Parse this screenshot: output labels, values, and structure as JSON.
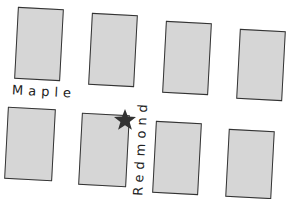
{
  "map": {
    "streets": [
      {
        "name": "Maple",
        "orientation": "horizontal"
      },
      {
        "name": "Redmond",
        "orientation": "vertical"
      }
    ],
    "landmark": {
      "type": "star",
      "color": "#333333",
      "location": "corner of Maple and Redmond"
    },
    "block_color": "#d6d6d6",
    "block_border_color": "#333333",
    "blocks": [
      {
        "id": "block-top-1",
        "row": "top",
        "col": 1
      },
      {
        "id": "block-top-2",
        "row": "top",
        "col": 2
      },
      {
        "id": "block-top-3",
        "row": "top",
        "col": 3
      },
      {
        "id": "block-top-4",
        "row": "top",
        "col": 4
      },
      {
        "id": "block-bottom-1",
        "row": "bottom",
        "col": 1
      },
      {
        "id": "block-bottom-2",
        "row": "bottom",
        "col": 2
      },
      {
        "id": "block-bottom-3",
        "row": "bottom",
        "col": 3
      },
      {
        "id": "block-bottom-4",
        "row": "bottom",
        "col": 4
      }
    ]
  }
}
